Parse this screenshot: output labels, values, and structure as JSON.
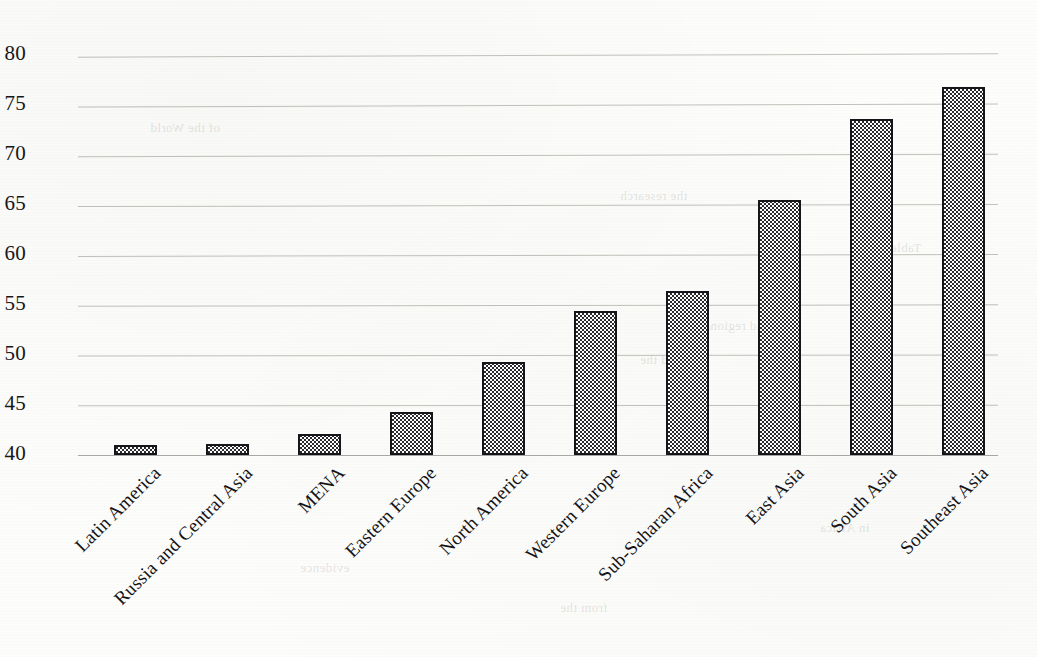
{
  "chart_data": {
    "type": "bar",
    "title": "",
    "subtitle": "",
    "xlabel": "",
    "ylabel": "",
    "ylim": [
      40,
      80
    ],
    "ytick_step": 5,
    "yticks": [
      "80",
      "75",
      "70",
      "65",
      "60",
      "55",
      "50",
      "45",
      "40"
    ],
    "grid": true,
    "legend": false,
    "categories": [
      "Latin America",
      "Russia and Central Asia",
      "MENA",
      "Eastern Europe",
      "North America",
      "Western Europe",
      "Sub-Saharan Africa",
      "East Asia",
      "South Asia",
      "Southeast Asia"
    ],
    "values": [
      41.0,
      41.1,
      42.1,
      44.3,
      49.3,
      54.4,
      56.4,
      65.5,
      73.6,
      76.8
    ],
    "bar_fill": "checkered-gray",
    "bar_border_color": "#16161a",
    "gridline_color": "#b9b7b2",
    "text_color": "#141316",
    "background_color": "#fdfdfb"
  },
  "scan_artifacts": {
    "ghost_text": [
      "the research",
      "and regional",
      "Asia and the",
      "of the World",
      "evidence",
      "from the",
      "in Africa",
      "Table 1"
    ]
  }
}
